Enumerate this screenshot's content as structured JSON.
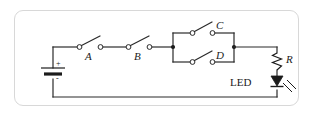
{
  "diagram": {
    "frame": {
      "style": "rounded-rectangle",
      "color": "#d8d8d8"
    },
    "wire_color": "#2a2a2a",
    "components": {
      "battery": {
        "name": "battery",
        "plus_label": "+",
        "minus_label": "-"
      },
      "switch_a": {
        "label": "A",
        "state": "open"
      },
      "switch_b": {
        "label": "B",
        "state": "open"
      },
      "switch_c": {
        "label": "C",
        "state": "open"
      },
      "switch_d": {
        "label": "D",
        "state": "open"
      },
      "resistor": {
        "label": "R"
      },
      "led": {
        "label": "LED"
      }
    }
  }
}
